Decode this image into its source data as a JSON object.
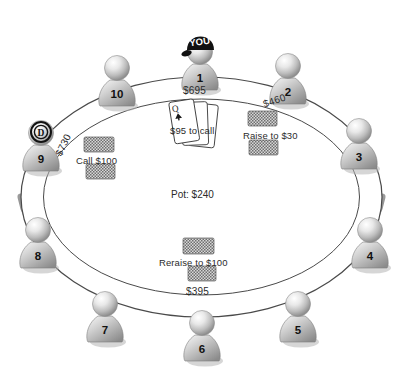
{
  "diagram": {
    "table_shape": "oval",
    "pot": "Pot: $240",
    "hero_marker": "YOU",
    "dealer_marker": "D",
    "seat_count": 10
  },
  "colors": {
    "ink": "#2b2b2b",
    "table_line": "#4a4a4a",
    "rim_dark": "#6e6e6e",
    "pawn_light": "#f2f2f2",
    "pawn_mid": "#b9b9b9",
    "pawn_dark": "#8a8a8a",
    "chip_gray": "#9a9a9a",
    "card_white": "#ffffff",
    "hat_black": "#111111"
  },
  "seats": [
    {
      "id": "seat-1",
      "number": "1",
      "x": 200,
      "y": 62,
      "stack": "$695",
      "hero": true,
      "dealer": false
    },
    {
      "id": "seat-2",
      "number": "2",
      "x": 288,
      "y": 76,
      "stack": "$460",
      "hero": false,
      "dealer": false
    },
    {
      "id": "seat-3",
      "number": "3",
      "x": 359,
      "y": 141,
      "stack": "",
      "hero": false,
      "dealer": false
    },
    {
      "id": "seat-4",
      "number": "4",
      "x": 370,
      "y": 240,
      "stack": "",
      "hero": false,
      "dealer": false
    },
    {
      "id": "seat-5",
      "number": "5",
      "x": 298,
      "y": 314,
      "stack": "",
      "hero": false,
      "dealer": false
    },
    {
      "id": "seat-6",
      "number": "6",
      "x": 202,
      "y": 333,
      "stack": "$395",
      "hero": false,
      "dealer": false
    },
    {
      "id": "seat-7",
      "number": "7",
      "x": 105,
      "y": 314,
      "stack": "",
      "hero": false,
      "dealer": false
    },
    {
      "id": "seat-8",
      "number": "8",
      "x": 38,
      "y": 240,
      "stack": "",
      "hero": false,
      "dealer": false
    },
    {
      "id": "seat-9",
      "number": "9",
      "x": 41,
      "y": 143,
      "stack": "$730",
      "hero": false,
      "dealer": true
    },
    {
      "id": "seat-10",
      "number": "10",
      "x": 117,
      "y": 78,
      "stack": "",
      "hero": false,
      "dealer": false
    }
  ],
  "stack_labels": [
    {
      "name": "stack-label-seat-1",
      "text": "$695",
      "x": 183,
      "y": 86,
      "rotate": 0
    },
    {
      "name": "stack-label-seat-2",
      "text": "$460",
      "x": 263,
      "y": 96,
      "rotate": -19
    },
    {
      "name": "stack-label-seat-9",
      "text": "$730",
      "x": 52,
      "y": 140,
      "rotate": -64
    },
    {
      "name": "stack-label-seat-6",
      "text": "$395",
      "x": 186,
      "y": 287,
      "rotate": 0
    }
  ],
  "actions": [
    {
      "name": "action-hero-to-call",
      "text": "$95 to call",
      "x": 170,
      "y": 126,
      "has_cards": true,
      "has_chips": false
    },
    {
      "name": "action-raise",
      "text": "Raise to $30",
      "x": 243,
      "y": 131,
      "has_cards": false,
      "has_chips": true
    },
    {
      "name": "action-call",
      "text": "Call $100",
      "x": 76,
      "y": 156,
      "has_cards": false,
      "has_chips": true
    },
    {
      "name": "action-reraise",
      "text": "Reraise to $100",
      "x": 159,
      "y": 258,
      "has_cards": false,
      "has_chips": true
    }
  ],
  "pot": {
    "name": "pot-amount",
    "text": "Pot: $240",
    "x": 171,
    "y": 190
  },
  "hero_cards": [
    {
      "rank": "Q",
      "suit": "club"
    },
    {
      "rank": "Q",
      "suit": "spade"
    },
    {
      "rank": "Q",
      "suit": "face"
    }
  ]
}
